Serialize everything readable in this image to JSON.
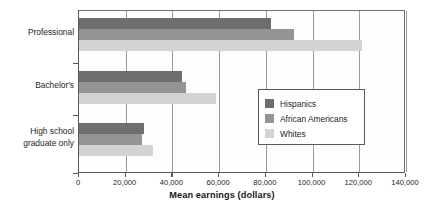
{
  "chart_data": {
    "type": "bar",
    "orientation": "horizontal",
    "title": "",
    "xlabel": "Mean earnings (dollars)",
    "ylabel": "",
    "xlim": [
      0,
      140000
    ],
    "xticks": [
      "0",
      "20,000",
      "40,000",
      "60,000",
      "80,000",
      "100,000",
      "120,000",
      "140,000"
    ],
    "xtick_values": [
      0,
      20000,
      40000,
      60000,
      80000,
      100000,
      120000,
      140000
    ],
    "grid": "vertical",
    "legend_position": "middle-right",
    "categories": [
      "Professional",
      "Bachelor's",
      "High school graduate only"
    ],
    "category_lines": [
      [
        "Professional"
      ],
      [
        "Bachelor's"
      ],
      [
        "High school",
        "graduate only"
      ]
    ],
    "series": [
      {
        "name": "Hispanics",
        "color": "#6e6e70",
        "values": [
          82000,
          44000,
          28000
        ]
      },
      {
        "name": "African Americans",
        "color": "#949496",
        "values": [
          92000,
          46000,
          27000
        ]
      },
      {
        "name": "Whites",
        "color": "#d3d3d4",
        "values": [
          121000,
          58500,
          31500
        ]
      }
    ]
  },
  "legend": {
    "items": [
      {
        "label": "Hispanics",
        "color": "#6e6e70"
      },
      {
        "label": "African Americans",
        "color": "#949496"
      },
      {
        "label": "Whites",
        "color": "#d3d3d4"
      }
    ]
  },
  "colors": {
    "axis": "#58585a",
    "grid": "#9a9a9c",
    "text": "#231f20",
    "plot_background": "#fdfdfd",
    "page_background": "#ffffff"
  }
}
